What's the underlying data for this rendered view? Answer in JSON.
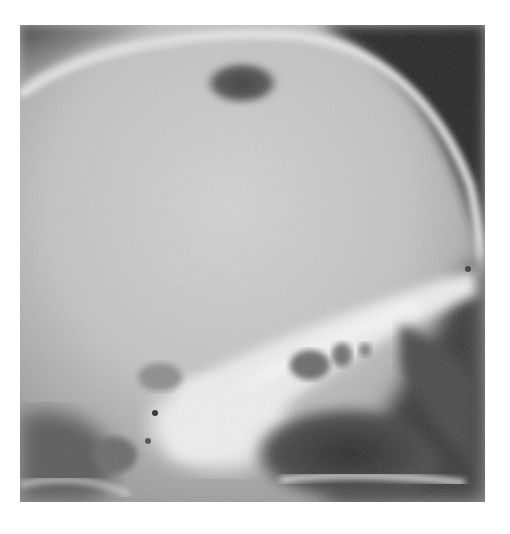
{
  "image": {
    "subject": "Lateral skull radiograph",
    "type": "grayscale x-ray",
    "colors": {
      "background": "#ffffff",
      "bone_bright": "#f2f2f2",
      "cranial_vault": "#c4c4c4",
      "air_dark": "#2a2a2a",
      "lucent_lesion": "#4a4a4a"
    }
  }
}
